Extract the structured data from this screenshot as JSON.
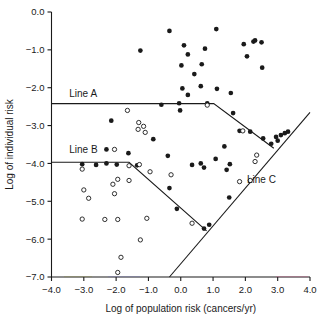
{
  "chart_data": {
    "type": "scatter",
    "title": "",
    "xlabel": "Log of population risk (cancers/yr)",
    "ylabel": "Log of individual risk",
    "xlim": [
      -4.0,
      4.0
    ],
    "ylim": [
      -7.0,
      0.0
    ],
    "xticks": [
      -4.0,
      -3.0,
      -2.0,
      -1.0,
      0.0,
      1.0,
      2.0,
      3.0,
      4.0
    ],
    "yticks": [
      0.0,
      -1.0,
      -2.0,
      -3.0,
      -4.0,
      -5.0,
      -6.0,
      -7.0
    ],
    "xtick_labels": [
      "-4.0",
      "-3.0",
      "-2.0",
      "-1.0",
      "0.0",
      "1.0",
      "2.0",
      "3.0",
      "4.0"
    ],
    "ytick_labels": [
      "0.0",
      "-1.0",
      "-2.0",
      "-3.0",
      "-4.0",
      "-5.0",
      "-6.0",
      "-7.0"
    ],
    "grid": false,
    "legend": null,
    "series": [
      {
        "name": "filled-markers",
        "marker": "filled-circle",
        "color": "#1a1a1a",
        "points": [
          [
            -0.35,
            -0.5
          ],
          [
            1.1,
            -0.45
          ],
          [
            -1.25,
            -1.02
          ],
          [
            0.1,
            -0.88
          ],
          [
            0.75,
            -0.97
          ],
          [
            1.95,
            -0.85
          ],
          [
            2.25,
            -0.78
          ],
          [
            2.3,
            -0.75
          ],
          [
            2.5,
            -0.8
          ],
          [
            0.22,
            -1.12
          ],
          [
            2.05,
            -1.17
          ],
          [
            0.02,
            -1.41
          ],
          [
            0.65,
            -1.38
          ],
          [
            2.52,
            -1.47
          ],
          [
            0.42,
            -1.64
          ],
          [
            0.05,
            -2.02
          ],
          [
            0.62,
            -1.96
          ],
          [
            1.12,
            -2.03
          ],
          [
            1.55,
            -2.14
          ],
          [
            0.22,
            -2.19
          ],
          [
            -0.6,
            -2.45
          ],
          [
            -0.05,
            -2.41
          ],
          [
            0.82,
            -2.41
          ],
          [
            -0.02,
            -2.6
          ],
          [
            1.62,
            -2.67
          ],
          [
            -2.15,
            -2.87
          ],
          [
            2.15,
            -3.16
          ],
          [
            1.82,
            -3.14
          ],
          [
            2.55,
            -3.34
          ],
          [
            2.95,
            -3.3
          ],
          [
            3.1,
            -3.25
          ],
          [
            3.22,
            -3.2
          ],
          [
            3.32,
            -3.16
          ],
          [
            -0.85,
            -3.36
          ],
          [
            2.8,
            -3.48
          ],
          [
            3.0,
            -3.4
          ],
          [
            1.35,
            -3.55
          ],
          [
            -1.62,
            -3.73
          ],
          [
            -2.3,
            -3.63
          ],
          [
            -0.4,
            -3.8
          ],
          [
            1.08,
            -3.88
          ],
          [
            -3.05,
            -4.02
          ],
          [
            -2.62,
            -4.04
          ],
          [
            -2.3,
            -4.0
          ],
          [
            -1.98,
            -4.03
          ],
          [
            -1.35,
            -4.05
          ],
          [
            0.35,
            -4.04
          ],
          [
            0.62,
            -4.0
          ],
          [
            1.52,
            -4.02
          ],
          [
            0.72,
            -4.11
          ],
          [
            1.42,
            -4.17
          ],
          [
            -0.35,
            -4.65
          ],
          [
            1.5,
            -4.9
          ],
          [
            -0.12,
            -5.2
          ],
          [
            0.72,
            -5.72
          ],
          [
            0.88,
            -5.62
          ]
        ]
      },
      {
        "name": "open-markers",
        "marker": "open-circle",
        "color": "#1a1a1a",
        "points": [
          [
            -1.65,
            -2.6
          ],
          [
            0.82,
            -2.46
          ],
          [
            -1.3,
            -2.92
          ],
          [
            -1.15,
            -3.02
          ],
          [
            1.92,
            -3.14
          ],
          [
            -1.32,
            -3.1
          ],
          [
            -1.1,
            -3.18
          ],
          [
            -2.05,
            -3.63
          ],
          [
            2.35,
            -3.78
          ],
          [
            -3.05,
            -4.15
          ],
          [
            -0.95,
            -4.22
          ],
          [
            -1.6,
            -4.06
          ],
          [
            -1.28,
            -4.03
          ],
          [
            -0.3,
            -4.3
          ],
          [
            2.3,
            -3.95
          ],
          [
            -1.95,
            -4.42
          ],
          [
            -1.6,
            -4.45
          ],
          [
            1.82,
            -4.48
          ],
          [
            2.15,
            -4.45
          ],
          [
            -3.0,
            -4.7
          ],
          [
            -2.1,
            -4.55
          ],
          [
            -2.85,
            -4.92
          ],
          [
            -2.05,
            -4.8
          ],
          [
            -3.05,
            -5.47
          ],
          [
            -2.35,
            -5.48
          ],
          [
            -1.95,
            -5.48
          ],
          [
            -1.05,
            -5.45
          ],
          [
            0.35,
            -5.58
          ],
          [
            -1.25,
            -6.02
          ],
          [
            -1.85,
            -6.48
          ],
          [
            -1.95,
            -6.88
          ]
        ]
      }
    ],
    "reference_lines": [
      {
        "id": "line-a",
        "label": "Line A",
        "label_position": [
          -3.45,
          -2.25
        ],
        "vertices": [
          [
            -4.0,
            -2.42
          ],
          [
            1.02,
            -2.42
          ],
          [
            2.88,
            -3.6
          ]
        ]
      },
      {
        "id": "line-b",
        "label": "Line B",
        "label_position": [
          -3.45,
          -3.72
        ],
        "vertices": [
          [
            -4.0,
            -3.97
          ],
          [
            -1.6,
            -3.97
          ],
          [
            0.8,
            -5.78
          ]
        ]
      },
      {
        "id": "line-c",
        "label": "Line C",
        "label_position": [
          2.05,
          -4.52
        ],
        "vertices": [
          [
            -0.35,
            -7.0
          ],
          [
            4.0,
            -2.65
          ]
        ]
      }
    ]
  },
  "axes": {
    "x_title": "Log of population risk (cancers/yr)",
    "y_title": "Log of individual risk"
  },
  "labels": {
    "line_a": "Line A",
    "line_b": "Line B",
    "line_c": "Line C"
  },
  "colors": {
    "ink": "#1a1a1a",
    "background": "#ffffff",
    "marker_fill": "#1a1a1a",
    "marker_open": "#ffffff"
  }
}
